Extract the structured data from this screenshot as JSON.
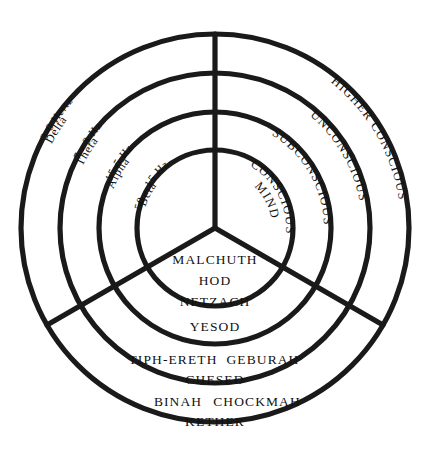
{
  "diagram": {
    "type": "concentric-wheel",
    "center": {
      "x": 215,
      "y": 228
    },
    "ring_radii": [
      78,
      116,
      155,
      194
    ],
    "stroke_color": "#1a1a1a",
    "background_color": "#ffffff",
    "text_color": "#111111",
    "spokes_degrees": [
      90,
      210,
      330
    ]
  },
  "brainwaves": {
    "sector_name": "brainwave-frequencies",
    "items": [
      {
        "name": "Delta",
        "frequency": "3-0 Hertz",
        "ring_index": 3
      },
      {
        "name": "Theta",
        "frequency": "7 - 3 Hz",
        "ring_index": 2
      },
      {
        "name": "Alpha",
        "frequency": "15-5 Hz",
        "ring_index": 1
      },
      {
        "name": "Beta",
        "frequency": "50 - 15 Hz",
        "ring_index": 0
      }
    ]
  },
  "consciousness": {
    "sector_name": "consciousness-levels",
    "items": [
      {
        "label": "HIGHER CONSCIOUS",
        "ring_index": 3
      },
      {
        "label": "UNCONSCIOUS",
        "ring_index": 2
      },
      {
        "label": "SUBCONSCIOUS",
        "ring_index": 1
      },
      {
        "label": "CONSCIOUS",
        "label_line2": "MIND",
        "ring_index": 0
      }
    ]
  },
  "sephiroth": {
    "sector_name": "sephiroth-tree-of-life",
    "rings": [
      {
        "ring_index": 0,
        "lines": [
          "MALCHUTH",
          "HOD",
          "NETZACH"
        ]
      },
      {
        "ring_index": 1,
        "lines": [
          "YESOD"
        ]
      },
      {
        "ring_index": 2,
        "lines": [
          "TIPH-ERETH   GEBURAH",
          "CHESED"
        ]
      },
      {
        "ring_index": 3,
        "lines": [
          "BINAH   CHOCKMAH",
          "KETHER"
        ]
      }
    ],
    "flat": {
      "malchuth": "MALCHUTH",
      "hod": "HOD",
      "netzach": "NETZACH",
      "yesod": "YESOD",
      "tiphereth": "TIPH-ERETH",
      "geburah": "GEBURAH",
      "chesed": "CHESED",
      "binah": "BINAH",
      "chockmah": "CHOCKMAH",
      "kether": "KETHER"
    }
  }
}
